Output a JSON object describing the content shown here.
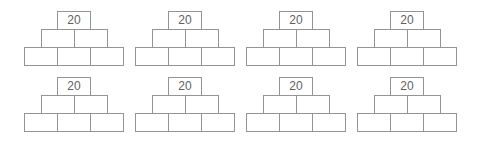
{
  "worksheet": {
    "background_color": "#ffffff",
    "cell_border_color": "#949494",
    "value_text_color": "#5f5f5f",
    "pyramid_rows": 2,
    "pyramid_columns": 4,
    "levels_per_pyramid": 3
  },
  "pyramids": [
    {
      "top": "20",
      "middle": [
        "",
        ""
      ],
      "bottom": [
        "",
        "",
        ""
      ]
    },
    {
      "top": "20",
      "middle": [
        "",
        ""
      ],
      "bottom": [
        "",
        "",
        ""
      ]
    },
    {
      "top": "20",
      "middle": [
        "",
        ""
      ],
      "bottom": [
        "",
        "",
        ""
      ]
    },
    {
      "top": "20",
      "middle": [
        "",
        ""
      ],
      "bottom": [
        "",
        "",
        ""
      ]
    },
    {
      "top": "20",
      "middle": [
        "",
        ""
      ],
      "bottom": [
        "",
        "",
        ""
      ]
    },
    {
      "top": "20",
      "middle": [
        "",
        ""
      ],
      "bottom": [
        "",
        "",
        ""
      ]
    },
    {
      "top": "20",
      "middle": [
        "",
        ""
      ],
      "bottom": [
        "",
        "",
        ""
      ]
    },
    {
      "top": "20",
      "middle": [
        "",
        ""
      ],
      "bottom": [
        "",
        "",
        ""
      ]
    }
  ]
}
